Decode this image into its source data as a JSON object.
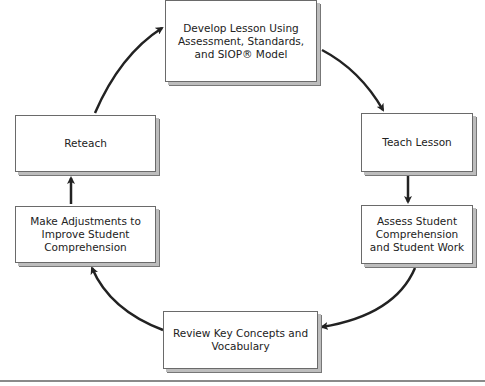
{
  "diagram": {
    "type": "cycle",
    "nodes": [
      {
        "id": "develop",
        "label": "Develop Lesson Using Assessment, Standards, and SIOP® Model"
      },
      {
        "id": "teach",
        "label": "Teach Lesson"
      },
      {
        "id": "assess",
        "label": "Assess Student Comprehension and Student Work"
      },
      {
        "id": "review",
        "label": "Review Key Concepts and Vocabulary"
      },
      {
        "id": "adjust",
        "label": "Make Adjustments to Improve Student Comprehension"
      },
      {
        "id": "reteach",
        "label": "Reteach"
      }
    ],
    "edges": [
      [
        "develop",
        "teach"
      ],
      [
        "teach",
        "assess"
      ],
      [
        "assess",
        "review"
      ],
      [
        "review",
        "adjust"
      ],
      [
        "adjust",
        "reteach"
      ],
      [
        "reteach",
        "develop"
      ]
    ]
  }
}
